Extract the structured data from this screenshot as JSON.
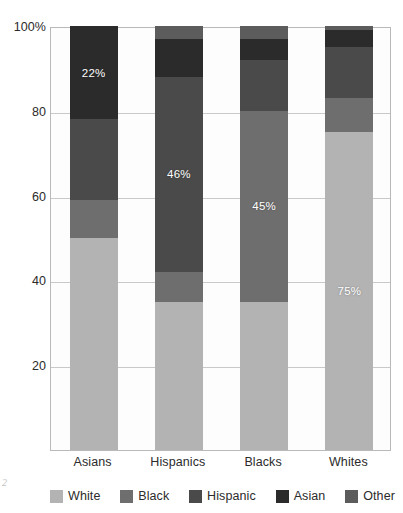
{
  "artifact": {
    "text": "2"
  },
  "chart_data": {
    "type": "bar",
    "subtype": "stacked-100-percent",
    "title": "",
    "subtitle": "",
    "xlabel": "",
    "ylabel": "",
    "categories": [
      "Asians",
      "Hispanics",
      "Blacks",
      "Whites"
    ],
    "ylim": [
      0,
      100
    ],
    "yticks": [
      20,
      40,
      60,
      80,
      100
    ],
    "ytick_labels": [
      "20",
      "40",
      "60",
      "80",
      "100%"
    ],
    "grid": true,
    "legend_position": "bottom",
    "series": [
      {
        "name": "White",
        "color": "#b3b3b3",
        "values": [
          50,
          35,
          35,
          75
        ]
      },
      {
        "name": "Black",
        "color": "#6e6e6e",
        "values": [
          9,
          7,
          45,
          8
        ]
      },
      {
        "name": "Hispanic",
        "color": "#4a4a4a",
        "values": [
          19,
          46,
          12,
          12
        ]
      },
      {
        "name": "Asian",
        "color": "#2b2b2b",
        "values": [
          22,
          9,
          5,
          4
        ]
      },
      {
        "name": "Other",
        "color": "#5c5c5c",
        "values": [
          0,
          3,
          3,
          1
        ]
      }
    ],
    "data_labels": [
      {
        "category": "Asians",
        "series": "Asian",
        "text": "22%"
      },
      {
        "category": "Hispanics",
        "series": "Hispanic",
        "text": "46%"
      },
      {
        "category": "Blacks",
        "series": "Black",
        "text": "45%"
      },
      {
        "category": "Whites",
        "series": "White",
        "text": "75%"
      }
    ]
  },
  "yaxis": {
    "ticks": [
      {
        "value": 100,
        "label": "100%"
      },
      {
        "value": 80,
        "label": "80"
      },
      {
        "value": 60,
        "label": "60"
      },
      {
        "value": 40,
        "label": "40"
      },
      {
        "value": 20,
        "label": "20"
      }
    ]
  },
  "xaxis": {
    "ticks": [
      {
        "label": "Asians"
      },
      {
        "label": "Hispanics"
      },
      {
        "label": "Blacks"
      },
      {
        "label": "Whites"
      }
    ]
  },
  "legend": {
    "items": [
      {
        "label": "White",
        "color": "#b3b3b3"
      },
      {
        "label": "Black",
        "color": "#6e6e6e"
      },
      {
        "label": "Hispanic",
        "color": "#4a4a4a"
      },
      {
        "label": "Asian",
        "color": "#2b2b2b"
      },
      {
        "label": "Other",
        "color": "#5c5c5c"
      }
    ]
  },
  "colors": {
    "white_series": "#b3b3b3",
    "black_series": "#6e6e6e",
    "hispanic_series": "#4a4a4a",
    "asian_series": "#2b2b2b",
    "other_series": "#5c5c5c",
    "gridline": "#c9c9c9",
    "axis": "#b9b9b9",
    "text": "#2b2b2b",
    "background": "#ffffff"
  }
}
